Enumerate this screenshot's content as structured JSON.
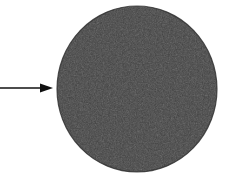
{
  "figure": {
    "background_color": "#ffffff",
    "canvas": {
      "width": 226,
      "height": 185
    },
    "disc": {
      "name": "circular disc specimen",
      "shape": "circle",
      "center_x": 137,
      "center_y": 89,
      "radius_x": 80,
      "radius_y": 83,
      "fill_color": "#3d3d3d",
      "edge_color": "#2e2e2e",
      "texture": "granular noise",
      "texture_light_color": "#4e4e4e",
      "texture_dark_color": "#2b2b2b"
    },
    "annotation_arrow": {
      "name": "pointer arrow",
      "direction": "right",
      "color": "#111111",
      "shaft_start_x": 0,
      "shaft_end_x": 41,
      "shaft_y": 88,
      "shaft_thickness": 1.6,
      "head_base_x": 40,
      "head_tip_x": 53,
      "head_half_height": 4.6,
      "points_to": "circular disc specimen"
    },
    "labels": {
      "caption": "",
      "scale_bar": ""
    }
  }
}
